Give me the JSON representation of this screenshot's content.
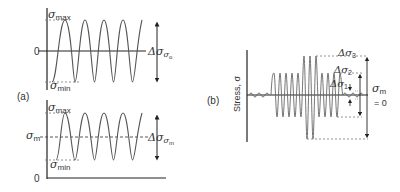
{
  "panel_a": {
    "label": "(a)",
    "top_plot": {
      "max_label": "σ",
      "max_sub": "max",
      "min_label": "σ",
      "min_sub": "min",
      "zero_label": "0",
      "range_label": "Δσ",
      "range_sub": "σ",
      "range_sub2": "o"
    },
    "bottom_plot": {
      "max_label": "σ",
      "max_sub": "max",
      "min_label": "σ",
      "min_sub": "min",
      "mean_label": "σ",
      "mean_sub": "m",
      "zero_label": "0",
      "range_label": "Δσ",
      "range_sub": "σ",
      "range_sub2": "m"
    }
  },
  "panel_b": {
    "label": "(b)",
    "y_axis_label": "Stress, σ",
    "mean_label": "σ",
    "mean_sub": "m",
    "mean_value": "= 0",
    "ranges": [
      {
        "label": "Δσ",
        "sub": "1"
      },
      {
        "label": "Δσ",
        "sub": "2"
      },
      {
        "label": "Δσ",
        "sub": "3"
      }
    ]
  },
  "colors": {
    "line": "#2a2a2a",
    "wave": "#555555",
    "dashed": "#777777"
  }
}
